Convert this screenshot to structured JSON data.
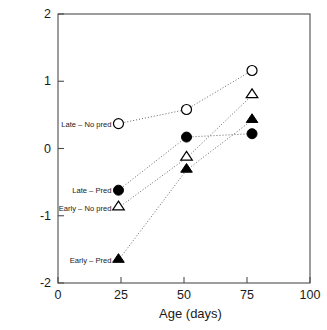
{
  "chart_data": {
    "type": "line",
    "title": "",
    "xlabel": "Age (days)",
    "ylabel": "PC1 (foraging behaviour)",
    "xlim": [
      0,
      100
    ],
    "ylim": [
      -2,
      2
    ],
    "xticks": [
      0,
      25,
      50,
      75,
      100
    ],
    "yticks": [
      2,
      1,
      0,
      -1,
      -2
    ],
    "xtick_labels": [
      "0",
      "25",
      "50",
      "75",
      "100"
    ],
    "ytick_labels": [
      "2",
      "1",
      "0",
      "-1",
      "-2"
    ],
    "grid": false,
    "legend_position": "inline-left-of-first-point",
    "line_style": "dotted",
    "line_color": "#555555",
    "marker_edge_color": "#000000",
    "background_color": "#ffffff",
    "series": [
      {
        "name": "Late – No pred",
        "marker": "open-circle",
        "filled": false,
        "shape": "circle",
        "x": [
          24,
          51,
          77
        ],
        "values": [
          0.37,
          0.58,
          1.16
        ],
        "label_x": 24,
        "label_y": 0.37
      },
      {
        "name": "Late – Pred",
        "marker": "filled-circle",
        "filled": true,
        "shape": "circle",
        "x": [
          24,
          51,
          77
        ],
        "values": [
          -0.62,
          0.17,
          0.22
        ],
        "label_x": 24,
        "label_y": -0.62
      },
      {
        "name": "Early – No pred",
        "marker": "open-triangle",
        "filled": false,
        "shape": "triangle",
        "x": [
          24,
          51,
          77
        ],
        "values": [
          -0.88,
          -0.14,
          0.79
        ],
        "label_x": 24,
        "label_y": -0.88
      },
      {
        "name": "Early – Pred",
        "marker": "filled-triangle",
        "filled": true,
        "shape": "triangle",
        "x": [
          24,
          51,
          77
        ],
        "values": [
          -1.66,
          -0.32,
          0.42
        ],
        "label_x": 24,
        "label_y": -1.66
      }
    ]
  }
}
